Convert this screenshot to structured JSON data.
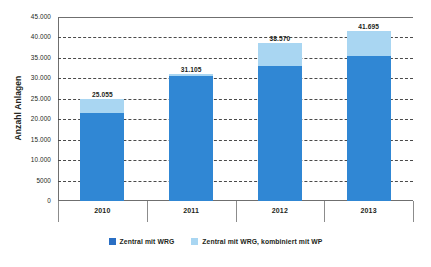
{
  "chart_data": {
    "type": "bar",
    "subtype": "stacked-column",
    "title": "",
    "xlabel": "",
    "ylabel": "Anzahl Anlagen",
    "categories": [
      "2010",
      "2011",
      "2012",
      "2013"
    ],
    "series": [
      {
        "name": "Zentral mit WRG",
        "color": "#3087d4",
        "values": [
          21500,
          30500,
          33000,
          35500
        ]
      },
      {
        "name": "Zentral mit WRG, kombiniert mit WP",
        "color": "#a9d6f2",
        "values": [
          3555,
          605,
          5570,
          6195
        ]
      }
    ],
    "totals": [
      25055,
      31105,
      38570,
      41695
    ],
    "total_labels": [
      "25.055",
      "31.105",
      "38.570",
      "41.695"
    ],
    "ylim": [
      0,
      45000
    ],
    "ytick_values": [
      0,
      5000,
      10000,
      15000,
      20000,
      25000,
      30000,
      35000,
      40000,
      45000
    ],
    "ytick_labels": [
      "0",
      "5000",
      "10.000",
      "15.000",
      "20.000",
      "25.000",
      "30.000",
      "35.000",
      "40.000",
      "45.000"
    ],
    "grid": true,
    "grid_style": "dashed",
    "legend_position": "bottom"
  },
  "axis": {
    "y_title": "Anzahl Anlagen"
  },
  "legend": {
    "items": [
      {
        "label": "Zentral mit WRG",
        "color": "#3087d4"
      },
      {
        "label": "Zentral mit WRG, kombiniert mit WP",
        "color": "#a9d6f2"
      }
    ]
  },
  "colors": {
    "primary": "#3087d4",
    "secondary": "#a9d6f2",
    "axis": "#6f6f6f",
    "grid": "#4a4a4a",
    "text": "#231f20",
    "background": "#ffffff"
  }
}
